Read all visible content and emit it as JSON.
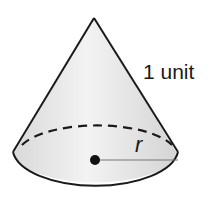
{
  "figure": {
    "shape": "cone",
    "slant_height_label": "1 unit",
    "radius_label": "r",
    "colors": {
      "stroke": "#1a1a1a",
      "fill_light": "#f2f2f2",
      "fill_dark": "#d6d6d6",
      "radius_line": "#777777"
    }
  }
}
